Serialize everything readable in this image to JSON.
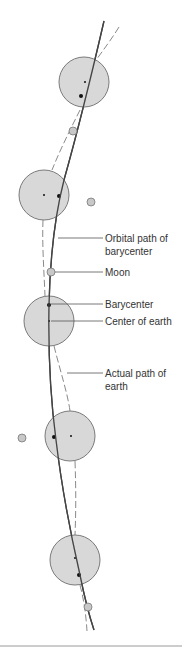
{
  "diagram": {
    "labels": {
      "orbital_path_line1": "Orbital path of",
      "orbital_path_line2": "barycenter",
      "moon": "Moon",
      "barycenter": "Barycenter",
      "center_of_earth": "Center of earth",
      "actual_path_line1": "Actual path of",
      "actual_path_line2": "earth"
    },
    "colors": {
      "earth_fill": "#d4d4d4",
      "earth_stroke": "#7a7a7a",
      "orbit_line": "#444444",
      "dashed_path": "#8a8a8a",
      "dot": "#111111",
      "divider": "#9a9a9a"
    }
  }
}
